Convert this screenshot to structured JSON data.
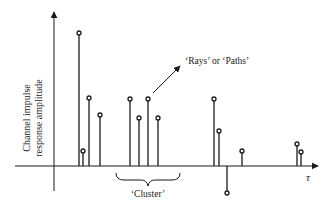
{
  "diagram": {
    "type": "stem-plot",
    "title": "",
    "ylabel": [
      "Channel impulse",
      "response amplitude"
    ],
    "xlabel": "τ",
    "annotations": {
      "rays": "‘Rays’ or ‘Paths’",
      "cluster": "‘Cluster’"
    },
    "colors": {
      "line": "#1a1a1a",
      "marker_fill": "#ffffff"
    }
  },
  "chart_data": {
    "type": "stem",
    "xlabel": "τ",
    "ylabel": "Channel impulse response amplitude",
    "grid": false,
    "legend": null,
    "groups": [
      {
        "name": "group-1",
        "x": [
          79,
          83,
          89,
          100
        ],
        "y": [
          133,
          15,
          68,
          51
        ]
      },
      {
        "name": "cluster",
        "x": [
          130,
          139,
          148,
          158
        ],
        "y": [
          67,
          48,
          67,
          48
        ]
      },
      {
        "name": "group-3",
        "x": [
          214,
          219,
          227,
          242
        ],
        "y": [
          67,
          35,
          -27,
          15
        ]
      },
      {
        "name": "group-4",
        "x": [
          297,
          301
        ],
        "y": [
          22,
          14
        ]
      }
    ]
  }
}
